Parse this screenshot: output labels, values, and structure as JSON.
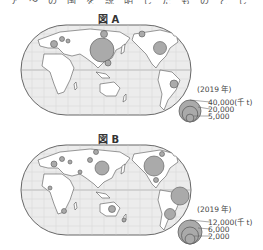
{
  "top_text": "ア　～　の　国　を　説　明　し　た　も　の　と　し　て　正　し　い　も　の　を　選　び　な　さ　い。",
  "figures": [
    {
      "title": "図 A",
      "year_label": "(2019 年)",
      "legend": {
        "unit": "(千 t)",
        "values": [
          "40,000(千 t)",
          "20,000",
          "5,000"
        ]
      },
      "symbols": [
        {
          "region": "China",
          "size": "largest"
        },
        {
          "region": "United States",
          "size": "medium"
        },
        {
          "region": "Brazil",
          "size": "small"
        },
        {
          "region": "Russia",
          "size": "small"
        },
        {
          "region": "Southeast Asia",
          "size": "small"
        },
        {
          "region": "Europe",
          "size": "small"
        }
      ]
    },
    {
      "title": "図 B",
      "year_label": "(2019 年)",
      "legend": {
        "unit": "(千 t)",
        "values": [
          "12,000(千 t)",
          "6,000",
          "2,000"
        ]
      },
      "symbols": [
        {
          "region": "Canada",
          "size": "large"
        },
        {
          "region": "China",
          "size": "large"
        },
        {
          "region": "Brazil",
          "size": "large"
        },
        {
          "region": "Argentina",
          "size": "medium"
        },
        {
          "region": "Australia",
          "size": "small"
        },
        {
          "region": "South Africa",
          "size": "small"
        },
        {
          "region": "Europe",
          "size": "small"
        },
        {
          "region": "Mexico",
          "size": "small"
        }
      ]
    }
  ],
  "colors": {
    "land": "#ffffff",
    "ocean": "#e8e8e8",
    "grid": "#c8c8c8",
    "outline": "#555555",
    "bubble_fill": "#aaaaaa",
    "bubble_stroke": "#555555"
  }
}
